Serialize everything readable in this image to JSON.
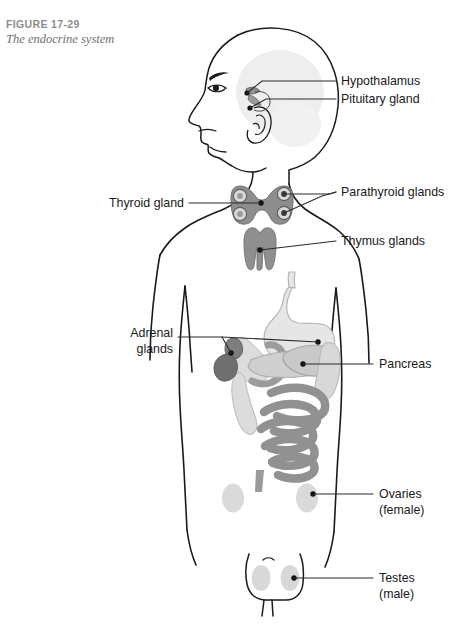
{
  "figure": {
    "number": "FIGURE 17-29",
    "title": "The endocrine system"
  },
  "diagram": {
    "type": "anatomical-illustration",
    "view": "anterior body with lateral head profile facing left",
    "labels": [
      {
        "id": "hypothalamus",
        "text": "Hypothalamus"
      },
      {
        "id": "pituitary-gland",
        "text": "Pituitary gland"
      },
      {
        "id": "thyroid-gland",
        "text": "Thyroid gland"
      },
      {
        "id": "parathyroid-glands",
        "text": "Parathyroid glands"
      },
      {
        "id": "thymus-glands",
        "text": "Thymus glands"
      },
      {
        "id": "adrenal-glands-line1",
        "text": "Adrenal"
      },
      {
        "id": "adrenal-glands-line2",
        "text": "glands"
      },
      {
        "id": "pancreas",
        "text": "Pancreas"
      },
      {
        "id": "ovaries-line1",
        "text": "Ovaries"
      },
      {
        "id": "ovaries-line2",
        "text": "(female)"
      },
      {
        "id": "testes-line1",
        "text": "Testes"
      },
      {
        "id": "testes-line2",
        "text": "(male)"
      }
    ],
    "colors": {
      "outline": "#1a1a1a",
      "leader_line": "#2b2b2b",
      "caption_number": "#8d8d8d",
      "caption_title": "#6f6f6f",
      "gland_medium_gray": "#8e8e8e",
      "gland_dark_gray": "#7c7c7c",
      "organ_light_gray": "#e2e2e2",
      "organ_pale_gray": "#d5d5d5",
      "intestine_gray": "#9a9a9a",
      "gonad_gray": "#d8d8d8",
      "brain_shade": "#ededed"
    }
  }
}
